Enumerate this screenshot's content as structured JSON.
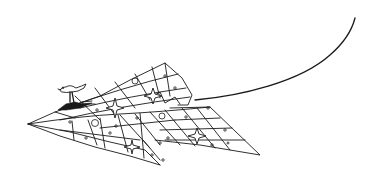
{
  "illustration": {
    "subject": "paper airplane with patterned panels carrying a small bird rider, trailing a curved string",
    "background_color": "#ffffff",
    "ink_color": "#1a1a1a",
    "elements": {
      "airplane": "paper-airplane",
      "rider": "bird-rider",
      "trail": "string-trail",
      "stars": 4,
      "large_circles": 3
    }
  }
}
